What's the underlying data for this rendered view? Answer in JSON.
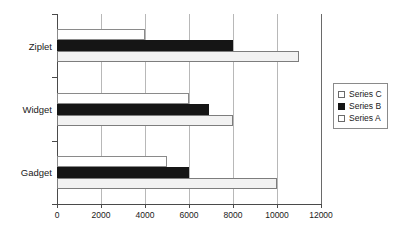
{
  "chart_data": {
    "type": "bar",
    "orientation": "horizontal",
    "title": "",
    "xlabel": "",
    "ylabel": "",
    "categories": [
      "Ziplet",
      "Widget",
      "Gadget"
    ],
    "series": [
      {
        "name": "Series C",
        "color": "#ffffff",
        "values": [
          4000,
          6000,
          5000
        ]
      },
      {
        "name": "Series B",
        "color": "#151515",
        "values": [
          8000,
          6900,
          6000
        ]
      },
      {
        "name": "Series A",
        "color": "#f2f2f2",
        "values": [
          11000,
          8000,
          10000
        ]
      }
    ],
    "xlim": [
      0,
      12000
    ],
    "xticks": [
      0,
      2000,
      4000,
      6000,
      8000,
      10000,
      12000
    ],
    "xtick_labels": [
      "0",
      "2000",
      "4000",
      "6000",
      "8000",
      "10000",
      "12000"
    ],
    "grid": true,
    "grid_axis": "x",
    "legend": {
      "position": "right",
      "entries": [
        "Series C",
        "Series B",
        "Series A"
      ]
    }
  }
}
